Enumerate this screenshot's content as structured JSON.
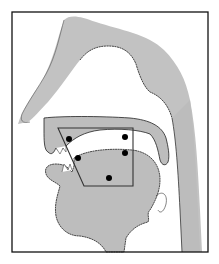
{
  "diagram": {
    "colors": {
      "background": "#ffffff",
      "tissue": "#bdbdbd",
      "tissue_light": "#c9c9c9",
      "outline": "#222222",
      "frame": "#111111",
      "quadrilateral": "#333333",
      "dot": "#000000"
    },
    "frame": {
      "x": 12,
      "y": 12,
      "width": 196,
      "height": 240
    },
    "quadrilateral": {
      "points": [
        [
          58,
          128
        ],
        [
          133,
          128
        ],
        [
          133,
          186
        ],
        [
          84,
          186
        ]
      ]
    },
    "points": [
      {
        "label": "front-high",
        "x": 69,
        "y": 139
      },
      {
        "label": "back-high",
        "x": 125,
        "y": 137
      },
      {
        "label": "front-mid",
        "x": 78,
        "y": 158
      },
      {
        "label": "back-mid",
        "x": 125,
        "y": 153
      },
      {
        "label": "low",
        "x": 109,
        "y": 178
      }
    ]
  }
}
